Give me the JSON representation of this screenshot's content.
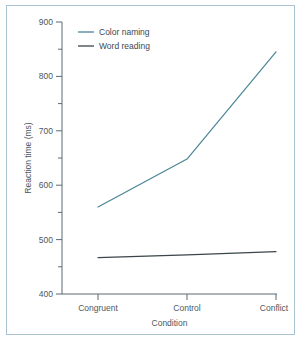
{
  "chart_data": {
    "type": "line",
    "title": "",
    "xlabel": "Condition",
    "ylabel": "Reaction time (ms)",
    "categories": [
      "Congruent",
      "Control",
      "Conflict"
    ],
    "ylim": [
      400,
      900
    ],
    "yticks": [
      400,
      500,
      600,
      700,
      800,
      900
    ],
    "ytick_labels": [
      "400",
      "500",
      "600",
      "700",
      "800",
      "900"
    ],
    "yminor_ticks": [
      450,
      550,
      650,
      750,
      850
    ],
    "grid": false,
    "legend_position": "upper left",
    "series": [
      {
        "name": "Color naming",
        "values": [
          560,
          648,
          845
        ],
        "color": "#4a8596"
      },
      {
        "name": "Word reading",
        "values": [
          467,
          472,
          478
        ],
        "color": "#394549"
      }
    ]
  },
  "figure": {
    "frame_color": "#a9c3d2",
    "background": "#ffffff",
    "axis_color": "#5a6b75"
  }
}
